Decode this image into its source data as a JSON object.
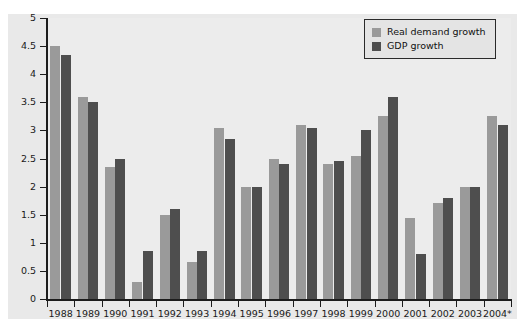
{
  "chart_data": {
    "type": "bar",
    "title": "",
    "subtitle": "",
    "xlabel": "",
    "ylabel": "",
    "ylim": [
      0,
      5
    ],
    "ytick_labels": [
      "0",
      "0.5",
      "1",
      "1.5",
      "2",
      "2.5",
      "3",
      "3.5",
      "4",
      "4.5",
      "5"
    ],
    "ytick_values": [
      0,
      0.5,
      1,
      1.5,
      2,
      2.5,
      3,
      3.5,
      4,
      4.5,
      5
    ],
    "grid": false,
    "legend_position": "top-right",
    "categories": [
      "1988",
      "1989",
      "1990",
      "1991",
      "1992",
      "1993",
      "1994",
      "1995",
      "1996",
      "1997",
      "1998",
      "1999",
      "2000",
      "2001",
      "2002",
      "2003",
      "2004*"
    ],
    "series": [
      {
        "name": "Real demand growth",
        "color": "#9a9a9a",
        "values": [
          4.5,
          3.6,
          2.35,
          0.3,
          1.5,
          0.65,
          3.05,
          2.0,
          2.5,
          3.1,
          2.4,
          2.55,
          3.25,
          1.45,
          1.7,
          2.0,
          3.25
        ]
      },
      {
        "name": "GDP growth",
        "color": "#4e4e4e",
        "values": [
          4.35,
          3.5,
          2.5,
          0.85,
          1.6,
          0.85,
          2.85,
          2.0,
          2.4,
          3.05,
          2.45,
          3.0,
          3.6,
          0.8,
          1.8,
          2.0,
          3.1
        ]
      }
    ]
  },
  "legend": {
    "items": [
      {
        "label": "Real demand growth",
        "swatch": "demand"
      },
      {
        "label": "GDP growth",
        "swatch": "gdp"
      }
    ]
  },
  "colors": {
    "demand": "#9a9a9a",
    "gdp": "#4e4e4e",
    "plot_background": "#ececec",
    "panel_background": "#e9e9e9",
    "axis": "#1c1c1c"
  }
}
